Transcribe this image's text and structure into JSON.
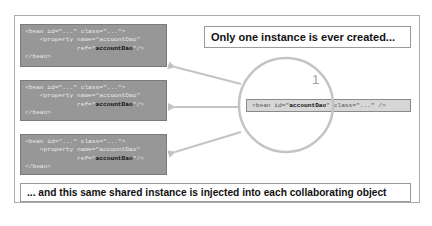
{
  "title": "Only one instance is ever created...",
  "footer": "... and this same shared instance is injected into each collaborating object",
  "instance_count_label": "1",
  "collaborator_beans": [
    {
      "line1_a": "<bean id=\"...\" class=\"...\">",
      "line2": "    <property name=\"accountDao\"",
      "line3_a": "              ref=\"",
      "line3_b": "accountDao",
      "line3_c": "\"/>",
      "line4": "</bean>"
    },
    {
      "line1_a": "<bean id=\"...\" class=\"...\">",
      "line2": "    <property name=\"accountDao\"",
      "line3_a": "              ref=\"",
      "line3_b": "accountDao",
      "line3_c": "\"/>",
      "line4": "</bean>"
    },
    {
      "line1_a": "<bean id=\"...\" class=\"...\">",
      "line2": "    <property name=\"accountDao\"",
      "line3_a": "              ref=\"",
      "line3_b": "accountDao",
      "line3_c": "\"/>",
      "line4": "</bean>"
    }
  ],
  "shared_bean": {
    "prefix": "<bean id=\"",
    "id": "accountDao",
    "suffix": "\" class=\"...\" />"
  },
  "colors": {
    "bean_bg": "#979797",
    "circle": "#c4c4c4",
    "arrow": "#c4c4c4",
    "frame": "#a9a9a9"
  }
}
